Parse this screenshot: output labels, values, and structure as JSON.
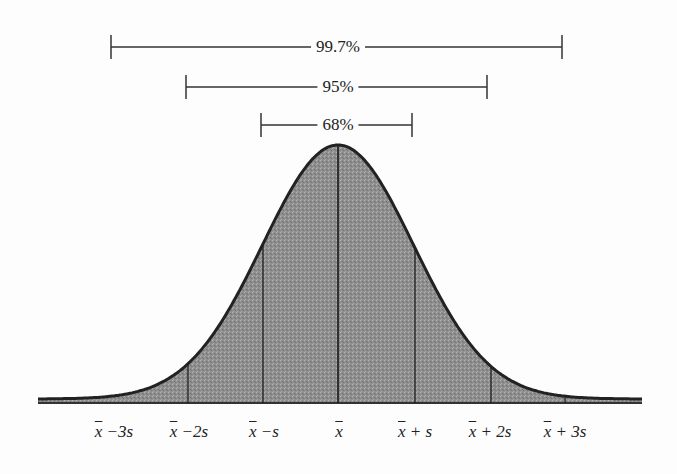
{
  "title": "",
  "intervals": [
    {
      "label": "99.7%",
      "range": "±3s",
      "x1": 111,
      "x2": 562,
      "y": 47
    },
    {
      "label": "95%",
      "range": "±2s",
      "x1": 186,
      "x2": 487,
      "y": 87
    },
    {
      "label": "68%",
      "range": "±1s",
      "x1": 261,
      "x2": 412,
      "y": 125
    }
  ],
  "x_axis": {
    "ticks": [
      {
        "label": "x̄ −3s",
        "base": "x",
        "suffix": "−3s",
        "x": 114
      },
      {
        "label": "x̄ −2s",
        "base": "x",
        "suffix": "−2s",
        "x": 189
      },
      {
        "label": "x̄ −s",
        "base": "x",
        "suffix": "−s",
        "x": 264
      },
      {
        "label": "x̄",
        "base": "x",
        "suffix": "",
        "x": 339
      },
      {
        "label": "x̄ + s",
        "base": "x",
        "suffix": "+ s",
        "x": 415
      },
      {
        "label": "x̄ + 2s",
        "base": "x",
        "suffix": "+ 2s",
        "x": 490
      },
      {
        "label": "x̄ + 3s",
        "base": "x",
        "suffix": "+ 3s",
        "x": 565
      }
    ]
  },
  "curve": {
    "type": "normal",
    "mean_x": 338,
    "sd_px": 75.5,
    "peak_y": 145,
    "baseline_y": 403,
    "fill_color": "#8f8f8f",
    "stroke_color": "#222222",
    "divider_x": [
      188,
      263,
      338,
      415,
      491,
      565
    ]
  }
}
